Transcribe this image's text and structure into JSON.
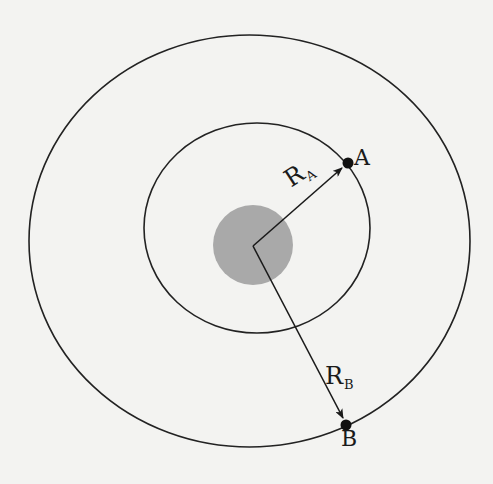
{
  "diagram": {
    "type": "concentric-orbits",
    "colors": {
      "background": "#f3f3f1",
      "stroke": "#222222",
      "central_body": "#a9a9a9",
      "points": "#111111"
    },
    "outer_orbit": {
      "cx": 249.5,
      "cy": 241,
      "rx": 220.5,
      "ry": 206
    },
    "inner_orbit": {
      "cx": 257,
      "cy": 228,
      "rx": 113,
      "ry": 105
    },
    "central_body": {
      "cx": 253,
      "cy": 245,
      "r": 40
    },
    "center": {
      "x": 253,
      "y": 246
    },
    "points": [
      {
        "id": "A",
        "label": "A",
        "x": 348,
        "y": 163,
        "orbit": "inner"
      },
      {
        "id": "B",
        "label": "B",
        "x": 346,
        "y": 425,
        "orbit": "outer"
      }
    ],
    "vectors": [
      {
        "id": "RA",
        "label_main": "R",
        "label_sub": "A",
        "from": "center",
        "to": "A"
      },
      {
        "id": "RB",
        "label_main": "R",
        "label_sub": "B",
        "from": "center",
        "to": "B"
      }
    ]
  },
  "labels": {
    "point_a": "A",
    "point_b": "B",
    "radius_a_main": "R",
    "radius_a_sub": "A",
    "radius_b_main": "R",
    "radius_b_sub": "B"
  }
}
